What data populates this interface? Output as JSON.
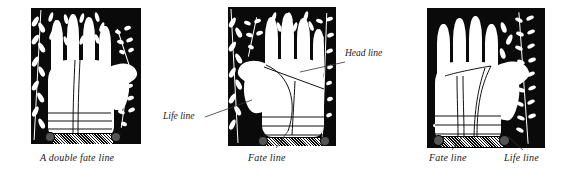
{
  "figure": {
    "kind": "palmistry-illustration-set",
    "panel_count": 3,
    "ink_color": "#0a0a0a",
    "paper_color": "#ffffff"
  },
  "panels": [
    {
      "id": "panel-left",
      "caption": "A double fate line",
      "labels": []
    },
    {
      "id": "panel-middle",
      "caption": "Fate line",
      "labels": [
        {
          "text": "Head line",
          "position": "right"
        },
        {
          "text": "Life line",
          "position": "left"
        }
      ]
    },
    {
      "id": "panel-right",
      "caption": "",
      "labels": [],
      "captions": [
        {
          "text": "Fate line"
        },
        {
          "text": "Life line"
        }
      ]
    }
  ]
}
